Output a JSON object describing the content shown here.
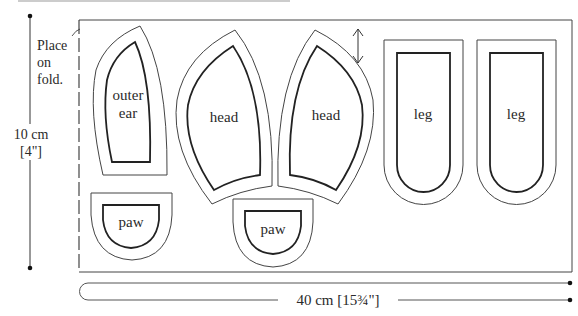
{
  "diagram": {
    "type": "sewing-pattern-layout",
    "title_clipped": true,
    "fold_note": {
      "line1": "Place",
      "line2": "on",
      "line3": "fold."
    },
    "height_dimension": {
      "value": "10 cm",
      "imperial": "[4\"]"
    },
    "width_dimension": {
      "label": "40 cm [15¾\"]"
    },
    "grain_arrow": "double-headed-arrow",
    "pieces": [
      {
        "name": "outer-ear",
        "line1": "outer",
        "line2": "ear"
      },
      {
        "name": "head-1",
        "label": "head"
      },
      {
        "name": "head-2",
        "label": "head"
      },
      {
        "name": "leg-1",
        "label": "leg"
      },
      {
        "name": "leg-2",
        "label": "leg"
      },
      {
        "name": "paw-1",
        "label": "paw"
      },
      {
        "name": "paw-2",
        "label": "paw"
      }
    ],
    "colors": {
      "line": "#444444",
      "seam": "#222222",
      "background": "#ffffff"
    }
  }
}
